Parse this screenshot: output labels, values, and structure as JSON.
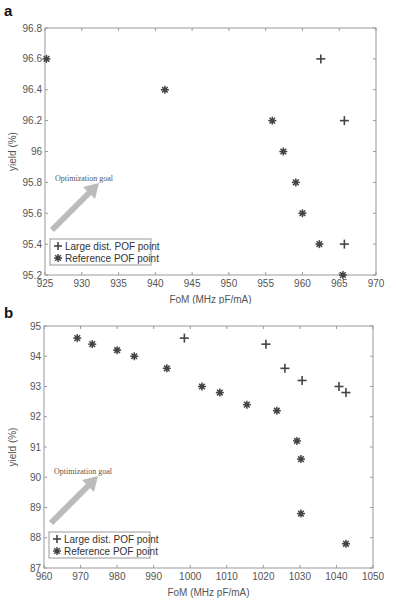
{
  "panels": [
    {
      "label": "a"
    },
    {
      "label": "b"
    }
  ],
  "chart_data": [
    {
      "type": "scatter",
      "panel": "a",
      "title": "",
      "xlabel": "FoM (MHz pF/mA)",
      "ylabel": "yield (%)",
      "xlim": [
        925,
        970
      ],
      "ylim": [
        95.2,
        96.8
      ],
      "xticks": [
        925,
        930,
        935,
        940,
        945,
        950,
        955,
        960,
        965,
        970
      ],
      "yticks": [
        95.2,
        95.4,
        95.6,
        95.8,
        96,
        96.2,
        96.4,
        96.6,
        96.8
      ],
      "xtick_labels": [
        "925",
        "930",
        "935",
        "940",
        "945",
        "950",
        "955",
        "960",
        "965",
        "970"
      ],
      "ytick_labels": [
        "95.2",
        "95.4",
        "95.6",
        "95.8",
        "96",
        "96.2",
        "96.4",
        "96.6",
        "96.8"
      ],
      "grid": false,
      "legend_position": "lower left",
      "annotation": "Optimization goal",
      "series": [
        {
          "name": "Large dist. POF point",
          "marker": "plus",
          "points": [
            [
              962.5,
              96.6
            ],
            [
              965.7,
              96.2
            ],
            [
              965.7,
              95.4
            ]
          ]
        },
        {
          "name": "Reference POF point",
          "marker": "asterisk",
          "points": [
            [
              925.2,
              96.6
            ],
            [
              941.3,
              96.4
            ],
            [
              955.9,
              96.2
            ],
            [
              957.4,
              96.0
            ],
            [
              959.1,
              95.8
            ],
            [
              960.0,
              95.6
            ],
            [
              962.3,
              95.4
            ],
            [
              965.5,
              95.2
            ]
          ]
        }
      ]
    },
    {
      "type": "scatter",
      "panel": "b",
      "title": "",
      "xlabel": "FoM (MHz pF/mA)",
      "ylabel": "yield (%)",
      "xlim": [
        960,
        1050
      ],
      "ylim": [
        87,
        95
      ],
      "xticks": [
        960,
        970,
        980,
        990,
        1000,
        1010,
        1020,
        1030,
        1040,
        1050
      ],
      "yticks": [
        87,
        88,
        89,
        90,
        91,
        92,
        93,
        94,
        95
      ],
      "xtick_labels": [
        "960",
        "970",
        "980",
        "990",
        "1000",
        "1010",
        "1020",
        "1030",
        "1040",
        "1050"
      ],
      "ytick_labels": [
        "87",
        "88",
        "89",
        "90",
        "91",
        "92",
        "93",
        "94",
        "95"
      ],
      "grid": false,
      "legend_position": "lower left",
      "annotation": "Optimization goal",
      "series": [
        {
          "name": "Large dist. POF point",
          "marker": "plus",
          "points": [
            [
              998.4,
              94.6
            ],
            [
              1020.7,
              94.4
            ],
            [
              1025.9,
              93.6
            ],
            [
              1030.6,
              93.2
            ],
            [
              1040.7,
              93.0
            ],
            [
              1042.6,
              92.8
            ]
          ]
        },
        {
          "name": "Reference POF point",
          "marker": "asterisk",
          "points": [
            [
              969.1,
              94.6
            ],
            [
              973.2,
              94.4
            ],
            [
              980.0,
              94.2
            ],
            [
              984.7,
              94.0
            ],
            [
              993.6,
              93.6
            ],
            [
              1003.2,
              93.0
            ],
            [
              1008.1,
              92.8
            ],
            [
              1015.5,
              92.4
            ],
            [
              1023.7,
              92.2
            ],
            [
              1029.2,
              91.2
            ],
            [
              1030.3,
              90.6
            ],
            [
              1030.3,
              88.8
            ],
            [
              1042.6,
              87.8
            ]
          ]
        }
      ]
    }
  ],
  "colors": {
    "axis": "#999999",
    "marker": "#444444",
    "arrow": "#bbbbbb",
    "legend_border": "#999999"
  }
}
